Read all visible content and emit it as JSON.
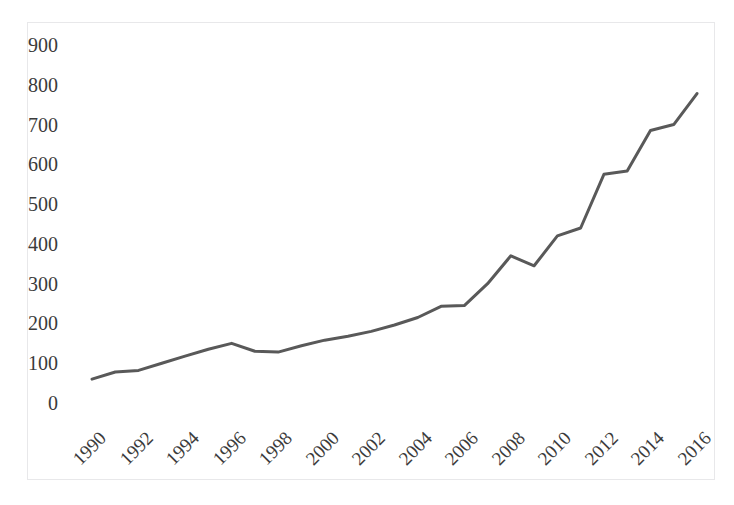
{
  "chart_data": {
    "type": "line",
    "title": "",
    "subtitle": "",
    "xlabel": "",
    "ylabel": "",
    "x": [
      1990,
      1991,
      1992,
      1993,
      1994,
      1995,
      1996,
      1997,
      1998,
      1999,
      2000,
      2001,
      2002,
      2003,
      2004,
      2005,
      2006,
      2007,
      2008,
      2009,
      2010,
      2011,
      2012,
      2013,
      2014,
      2015,
      2016
    ],
    "values": [
      60,
      78,
      82,
      100,
      118,
      135,
      150,
      130,
      128,
      144,
      158,
      168,
      180,
      196,
      215,
      243,
      245,
      300,
      370,
      345,
      420,
      440,
      575,
      583,
      685,
      700,
      778
    ],
    "series": [
      {
        "name": "series-1",
        "values": [
          60,
          78,
          82,
          100,
          118,
          135,
          150,
          130,
          128,
          144,
          158,
          168,
          180,
          196,
          215,
          243,
          245,
          300,
          370,
          345,
          420,
          440,
          575,
          583,
          685,
          700,
          778
        ],
        "color": "#595959"
      }
    ],
    "ylim": [
      0,
      900
    ],
    "xlim": [
      1990,
      2016
    ],
    "yticks": [
      0,
      100,
      200,
      300,
      400,
      500,
      600,
      700,
      800,
      900
    ],
    "ytick_labels": [
      "0",
      "100",
      "200",
      "300",
      "400",
      "500",
      "600",
      "700",
      "800",
      "900"
    ],
    "xticks": [
      1990,
      1992,
      1994,
      1996,
      1998,
      2000,
      2002,
      2004,
      2006,
      2008,
      2010,
      2012,
      2014,
      2016
    ],
    "xtick_labels": [
      "1990",
      "1992",
      "1994",
      "1996",
      "1998",
      "2000",
      "2002",
      "2004",
      "2006",
      "2008",
      "2010",
      "2012",
      "2014",
      "2016"
    ],
    "xtick_rotation": -45,
    "grid": false,
    "legend": false,
    "legend_position": "none",
    "markers": false,
    "line_width": 3,
    "plot_border_color": "#e8e8ea",
    "background_color": "#ffffff",
    "tick_label_color": "#3b3b3b"
  }
}
